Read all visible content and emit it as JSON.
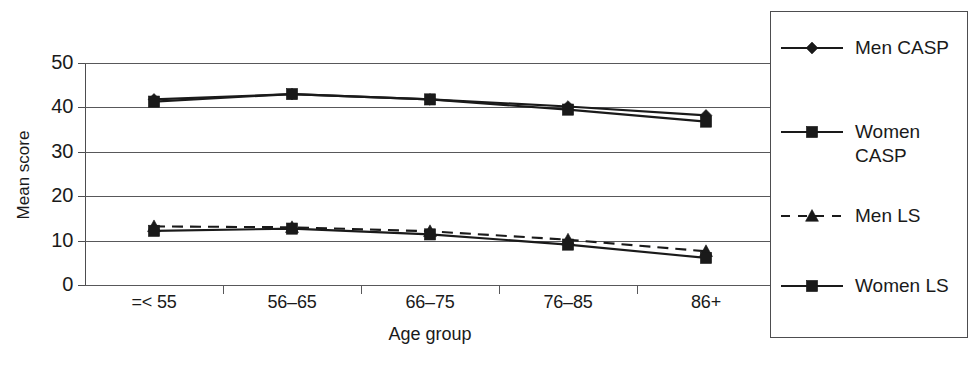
{
  "chart_data": {
    "type": "line",
    "title": "",
    "xlabel": "Age group",
    "ylabel": "Mean score",
    "categories": [
      "=< 55",
      "56–65",
      "66–75",
      "76–85",
      "86+"
    ],
    "ylim": [
      0,
      50
    ],
    "yticks": [
      0,
      10,
      20,
      30,
      40,
      50
    ],
    "grid": true,
    "legend_position": "right",
    "series": [
      {
        "name": "Men CASP",
        "values": [
          41.8,
          43.0,
          41.8,
          40.2,
          38.2
        ],
        "marker": "diamond",
        "line_style": "solid",
        "color": "#1a1a1a"
      },
      {
        "name": "Women CASP",
        "values": [
          41.3,
          43.0,
          41.8,
          39.5,
          36.8
        ],
        "marker": "square",
        "line_style": "solid",
        "color": "#1a1a1a"
      },
      {
        "name": "Men LS",
        "values": [
          13.2,
          13.0,
          12.1,
          10.2,
          7.6
        ],
        "marker": "triangle",
        "line_style": "dashed",
        "color": "#1a1a1a"
      },
      {
        "name": "Women LS",
        "values": [
          12.2,
          12.7,
          11.4,
          9.1,
          6.1
        ],
        "marker": "square",
        "line_style": "solid",
        "color": "#1a1a1a"
      }
    ]
  },
  "legend": {
    "entries": [
      {
        "label": "Men CASP",
        "marker": "diamond",
        "line_style": "solid"
      },
      {
        "label": "Women\nCASP",
        "marker": "square",
        "line_style": "solid"
      },
      {
        "label": "Men LS",
        "marker": "triangle",
        "line_style": "dashed"
      },
      {
        "label": "Women LS",
        "marker": "square",
        "line_style": "solid"
      }
    ]
  },
  "style": {
    "axis_color": "#4d4d4f",
    "grid_color": "#58585a",
    "series_color": "#1a1a1a",
    "background": "#ffffff"
  }
}
